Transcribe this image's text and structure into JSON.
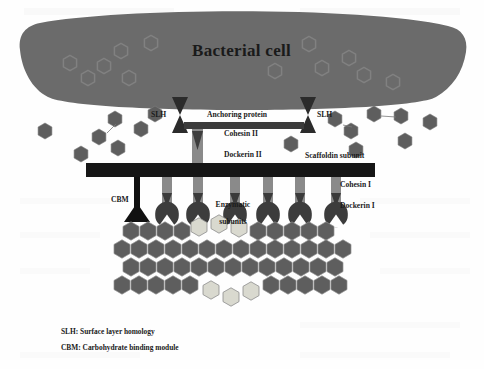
{
  "figure": {
    "type": "cellulosome-architecture-diagram",
    "background_color": "#fefefe",
    "palette": {
      "cell_body": "#6b6b6b",
      "cell_inner_hex_outline": "#7e7e7e",
      "dark_bar": "#1c1c1c",
      "gray_module": "#8a8a8a",
      "dark_module": "#3c3c3c",
      "hexagon_dark": "#5e5e5e",
      "hexagon_light": "#d8d8ce",
      "hexagon_outline": "#8c8c8c",
      "text": "#1a1a1a"
    },
    "title": "Bacterial cell",
    "labels": {
      "slh_left": "SLH",
      "slh_right": "SLH",
      "anchoring_protein": "Anchoring protein",
      "cohesin_ii": "Cohesin II",
      "dockerin_ii": "Dockerin II",
      "scaffoldin_subunit": "Scaffoldin subunit",
      "cohesin_i": "Cohesin I",
      "dockerin_i": "Dockerin I",
      "cbm": "CBM",
      "enzymatic_subunits_line1": "Enzymatic",
      "enzymatic_subunits_line2": "subunits"
    },
    "legend": [
      "SLH: Surface layer homology",
      "CBM: Carbohydrate binding module"
    ],
    "counts": {
      "cohesin_i_modules": 7,
      "enzymatic_subunits": 6,
      "slh_anchors": 2,
      "free_hexagons_left": 7,
      "free_hexagons_right": 8,
      "cell_interior_hexagons": 12,
      "substrate_rows": 4
    }
  }
}
